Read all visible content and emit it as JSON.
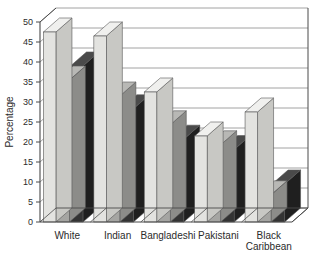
{
  "chart_data": {
    "type": "bar",
    "title": "",
    "xlabel": "",
    "ylabel": "Percentage",
    "ylim": [
      0,
      50
    ],
    "yticks": [
      0,
      5,
      10,
      15,
      20,
      25,
      30,
      35,
      40,
      45,
      50
    ],
    "ytick_labels": [
      "0",
      "5",
      "10",
      "15",
      "20",
      "25",
      "30",
      "35",
      "40",
      "45",
      "50"
    ],
    "grid": true,
    "legend": "none",
    "style": "3d-grouped-bars",
    "categories": [
      "White",
      "Indian",
      "Bangladeshi",
      "Pakistani",
      "Black Caribbean"
    ],
    "category_lines": [
      [
        "White"
      ],
      [
        "Indian"
      ],
      [
        "Bangladeshi"
      ],
      [
        "Pakistani"
      ],
      [
        "Black",
        "Caribbean"
      ]
    ],
    "series": [
      {
        "name": "Series 1",
        "color": "#e3e3e0",
        "values": [
          47.5,
          46.5,
          32.5,
          21.5,
          27.5
        ]
      },
      {
        "name": "Series 2",
        "color": "#a5a5a2",
        "values": [
          35.5,
          31.5,
          24.3,
          19.3,
          6.8
        ]
      },
      {
        "name": "Series 3",
        "color": "#333333",
        "values": [
          39.0,
          28.3,
          20.7,
          18.1,
          9.5
        ]
      }
    ]
  },
  "colors": {
    "series1": "#e3e3e0",
    "series2": "#a5a5a2",
    "series3": "#333333",
    "series1_side": "#c8c8c4",
    "series2_side": "#8c8c89",
    "series3_side": "#1f1f1f",
    "series1_top": "#f0f0ee",
    "series2_top": "#b8b8b5",
    "series3_top": "#4a4a4a",
    "axis": "#4a4a4a",
    "grid": "#8a8a8a",
    "text": "#2b2b2b",
    "background": "#ffffff"
  }
}
